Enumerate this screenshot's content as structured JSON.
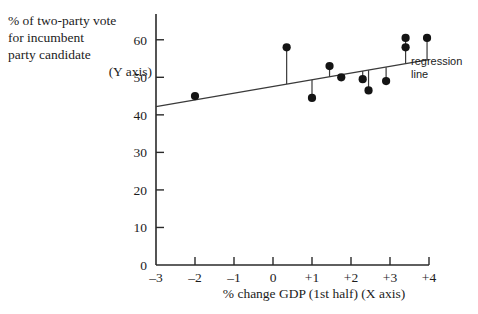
{
  "chart_data": {
    "type": "scatter",
    "title": "",
    "xlabel": "% change GDP (1st half)  (X axis)",
    "ylabel": "% of two-party vote for incumbent party candidate (Y axis)",
    "xlim": [
      -3,
      4
    ],
    "ylim": [
      0,
      65
    ],
    "xticks": [
      -3,
      -2,
      -1,
      0,
      1,
      2,
      3,
      4
    ],
    "xtick_labels": [
      "–3",
      "–2",
      "–1",
      "0",
      "+1",
      "+2",
      "+3",
      "+4"
    ],
    "yticks": [
      0,
      10,
      20,
      30,
      40,
      50,
      60
    ],
    "ytick_labels": [
      "0",
      "10",
      "20",
      "30",
      "40",
      "50",
      "60"
    ],
    "grid": false,
    "legend": false,
    "points": [
      {
        "x": -2.0,
        "y": 45.0
      },
      {
        "x": 0.35,
        "y": 58.0
      },
      {
        "x": 1.0,
        "y": 44.5
      },
      {
        "x": 1.45,
        "y": 53.0
      },
      {
        "x": 1.75,
        "y": 50.0
      },
      {
        "x": 2.3,
        "y": 49.5
      },
      {
        "x": 2.45,
        "y": 46.5
      },
      {
        "x": 2.9,
        "y": 49.0
      },
      {
        "x": 3.4,
        "y": 60.5
      },
      {
        "x": 3.4,
        "y": 58.0
      },
      {
        "x": 3.95,
        "y": 60.5
      }
    ],
    "regression_line": {
      "label": "regression line",
      "x_start": -3.0,
      "y_start": 42.2,
      "x_end": 4.0,
      "y_end": 54.7
    },
    "residual_segments": [
      {
        "x": 0.35,
        "y_point": 58.0,
        "y_line": 48.2
      },
      {
        "x": 1.0,
        "y_point": 44.5,
        "y_line": 49.3
      },
      {
        "x": 1.45,
        "y_point": 53.0,
        "y_line": 50.1
      },
      {
        "x": 1.75,
        "y_point": 50.0,
        "y_line": 50.7
      },
      {
        "x": 2.3,
        "y_point": 49.5,
        "y_line": 51.7
      },
      {
        "x": 2.45,
        "y_point": 46.5,
        "y_line": 51.9
      },
      {
        "x": 2.9,
        "y_point": 49.0,
        "y_line": 52.7
      },
      {
        "x": 3.4,
        "y_point": 60.5,
        "y_line": 53.6
      },
      {
        "x": 3.95,
        "y_point": 60.5,
        "y_line": 54.6
      }
    ],
    "marker_color": "#141414",
    "line_color": "#3a3a3a",
    "axis_color": "#2a2a2a",
    "background": "#ffffff"
  },
  "labels": {
    "y_axis_line1": "% of two-party vote",
    "y_axis_line2": "for incumbent",
    "y_axis_line3": "party candidate",
    "y_axis_line4": "(Y axis)",
    "x_axis_title": "% change GDP (1st half)  (X axis)",
    "annotation_line1": "regression",
    "annotation_line2": "line"
  }
}
